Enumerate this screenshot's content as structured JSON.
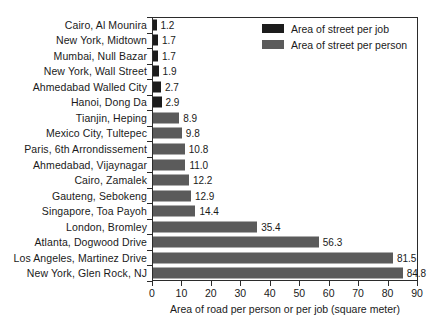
{
  "chart_data": {
    "type": "bar",
    "orientation": "horizontal",
    "title": "",
    "xlabel": "Area of road per person or per job (square meter)",
    "ylabel": "",
    "xlim": [
      0,
      90
    ],
    "xticks": [
      0,
      10,
      20,
      30,
      40,
      50,
      60,
      70,
      80,
      90
    ],
    "grid": false,
    "legend_position": "top-right",
    "categories": [
      "Cairo, Al Mounira",
      "New York, Midtown",
      "Mumbai, Null Bazar",
      "New York, Wall Street",
      "Ahmedabad Walled City",
      "Hanoi, Dong Da",
      "Tianjin, Heping",
      "Mexico City, Tultepec",
      "Paris, 6th Arrondissement",
      "Ahmedabad, Vijaynagar",
      "Cairo, Zamalek",
      "Gauteng, Sebokeng",
      "Singapore, Toa Payoh",
      "London, Bromley",
      "Atlanta, Dogwood Drive",
      "Los Angeles, Martinez Drive",
      "New York, Glen Rock, NJ"
    ],
    "values": [
      1.2,
      1.7,
      1.7,
      1.9,
      2.7,
      2.9,
      8.9,
      9.8,
      10.8,
      11.0,
      12.2,
      12.9,
      14.4,
      35.4,
      56.3,
      81.5,
      84.8
    ],
    "value_labels": [
      "1.2",
      "1.7",
      "1.7",
      "1.9",
      "2.7",
      "2.9",
      "8.9",
      "9.8",
      "10.8",
      "11.0",
      "12.2",
      "12.9",
      "14.4",
      "35.4",
      "56.3",
      "81.5",
      "84.8"
    ],
    "series_of_point": [
      "job",
      "job",
      "job",
      "job",
      "job",
      "job",
      "person",
      "person",
      "person",
      "person",
      "person",
      "person",
      "person",
      "person",
      "person",
      "person",
      "person"
    ],
    "series": [
      {
        "name": "Area of street per job",
        "key": "job",
        "color": "#1c1c1c"
      },
      {
        "name": "Area of street per person",
        "key": "person",
        "color": "#5b5b5b"
      }
    ],
    "legend": [
      {
        "label": "Area of street per job",
        "key": "job"
      },
      {
        "label": "Area of street per person",
        "key": "person"
      }
    ]
  }
}
